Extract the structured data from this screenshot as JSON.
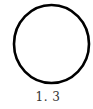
{
  "figure": {
    "shape": "circle",
    "stroke_color": "#000000",
    "fill_color": "#ffffff",
    "caption": "1. 3"
  }
}
